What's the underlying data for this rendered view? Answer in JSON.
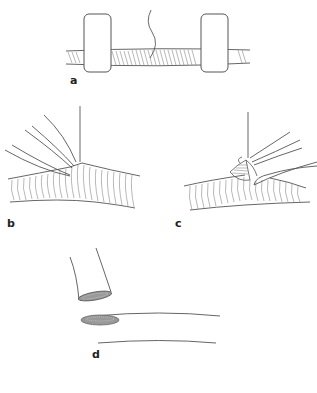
{
  "figure": {
    "panels": [
      {
        "id": "a",
        "label": "a",
        "description": "Vessel segment between two vascular clamps with suture"
      },
      {
        "id": "b",
        "label": "b",
        "description": "Branching vessel with forceps from left and suture needle"
      },
      {
        "id": "c",
        "label": "c",
        "description": "Branching vessel with forceps from right, everted intima"
      },
      {
        "id": "d",
        "label": "d",
        "description": "Vessel end approaching elliptical arteriotomy on host vessel"
      }
    ]
  },
  "colors": {
    "line": "#555555",
    "hatch": "#777777",
    "background": "#ffffff"
  }
}
